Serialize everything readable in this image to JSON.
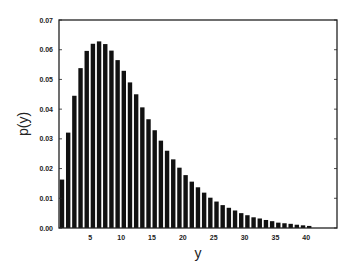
{
  "chart_data": {
    "type": "bar",
    "title": "",
    "xlabel": "y",
    "ylabel": "p(y)",
    "xlim": [
      0,
      45
    ],
    "ylim": [
      0,
      0.07
    ],
    "grid": false,
    "legend": null,
    "x_ticks": [
      5,
      10,
      15,
      20,
      25,
      30,
      35,
      40
    ],
    "y_ticks": [
      "0.00",
      "0.01",
      "0.02",
      "0.03",
      "0.04",
      "0.05",
      "0.06",
      "0.07"
    ],
    "x": [
      1,
      2,
      3,
      4,
      5,
      6,
      7,
      8,
      9,
      10,
      11,
      12,
      13,
      14,
      15,
      16,
      17,
      18,
      19,
      20,
      21,
      22,
      23,
      24,
      25,
      26,
      27,
      28,
      29,
      30,
      31,
      32,
      33,
      34,
      35,
      36,
      37,
      38,
      39,
      40,
      41
    ],
    "values": [
      0.0163,
      0.0321,
      0.0445,
      0.0538,
      0.0596,
      0.062,
      0.0628,
      0.0619,
      0.0597,
      0.0565,
      0.0529,
      0.049,
      0.045,
      0.0406,
      0.0366,
      0.0329,
      0.0294,
      0.026,
      0.0231,
      0.0203,
      0.0178,
      0.0156,
      0.0137,
      0.0119,
      0.0102,
      0.0089,
      0.0077,
      0.0068,
      0.0059,
      0.005,
      0.0043,
      0.0036,
      0.0032,
      0.0027,
      0.0023,
      0.0018,
      0.0016,
      0.0014,
      0.0011,
      0.0009,
      0.0007
    ],
    "bar_color": "#111111",
    "axis_color": "#222222"
  }
}
